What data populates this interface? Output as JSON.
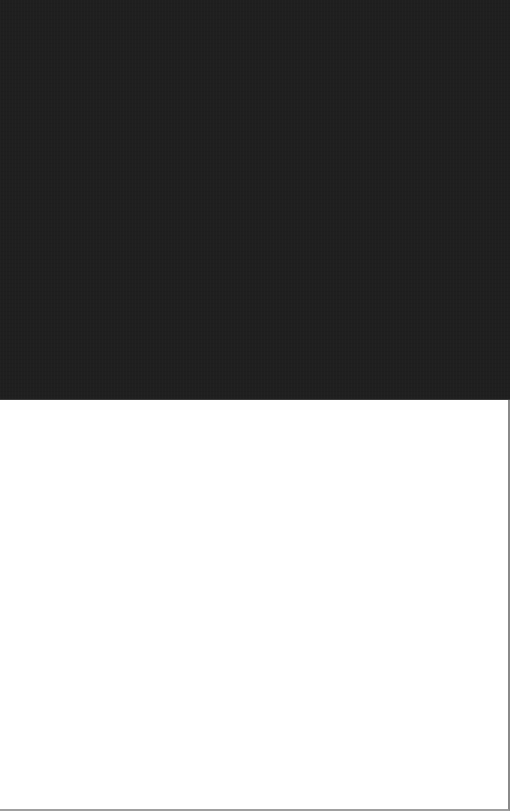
{
  "page": {
    "state": "",
    "colors": {
      "media_background": "#1f1f1f",
      "content_background": "#ffffff",
      "border": "#8a8a8a"
    }
  },
  "media": {
    "label": ""
  },
  "content": {
    "text": ""
  }
}
